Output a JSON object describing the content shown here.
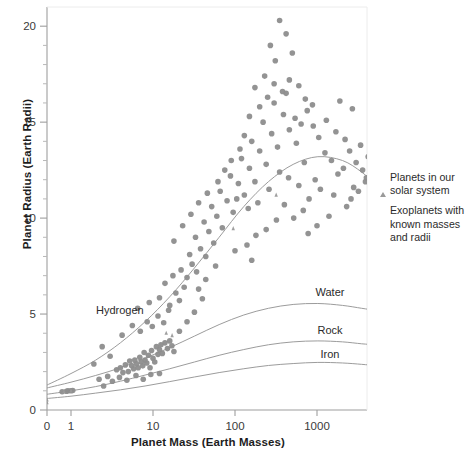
{
  "chart_data": {
    "type": "scatter",
    "title": "",
    "xlabel": "Planet Mass (Earth Masses)",
    "ylabel": "Planet Radius (Earth Radii)",
    "xscale": "log",
    "yscale": "linear",
    "xlim": [
      0.45,
      5000
    ],
    "ylim": [
      0,
      21
    ],
    "xticks": [
      0,
      1,
      10,
      100,
      1000
    ],
    "xticklabels": [
      "0",
      "1",
      "10",
      "100",
      "1000"
    ],
    "yticks": [
      0,
      5,
      10,
      15,
      20
    ],
    "yticklabels": [
      "0",
      "5",
      "10",
      "15",
      "20"
    ],
    "yminorticks": [
      1,
      2,
      3,
      4,
      6,
      7,
      8,
      9,
      11,
      12,
      13,
      14,
      16,
      17,
      18,
      19
    ],
    "grid": false,
    "legend_position": "right",
    "marker_color": "#8d8d8d",
    "curve_color": "#9c9c9c",
    "axis_color": "#b8b8b8",
    "series": [
      {
        "name": "Exoplanets with known masses and radii",
        "marker": "circle",
        "color": "#8d8d8d",
        "points": [
          [
            0.78,
            0.95
          ],
          [
            0.92,
            1.0
          ],
          [
            1.0,
            1.0
          ],
          [
            1.05,
            1.02
          ],
          [
            0.88,
            0.98
          ],
          [
            3.6,
            2.1
          ],
          [
            4.0,
            2.2
          ],
          [
            4.3,
            1.95
          ],
          [
            4.6,
            2.35
          ],
          [
            5.0,
            2.0
          ],
          [
            5.2,
            2.55
          ],
          [
            5.5,
            2.3
          ],
          [
            5.8,
            2.15
          ],
          [
            6.0,
            2.6
          ],
          [
            6.3,
            2.4
          ],
          [
            6.6,
            2.2
          ],
          [
            6.9,
            2.75
          ],
          [
            7.2,
            2.5
          ],
          [
            7.5,
            2.3
          ],
          [
            7.8,
            3.0
          ],
          [
            8.0,
            2.6
          ],
          [
            8.4,
            2.45
          ],
          [
            8.8,
            2.85
          ],
          [
            9.2,
            2.2
          ],
          [
            9.6,
            3.1
          ],
          [
            10.0,
            2.7
          ],
          [
            10.5,
            2.5
          ],
          [
            11.0,
            3.3
          ],
          [
            11.5,
            2.9
          ],
          [
            12.0,
            3.15
          ],
          [
            12.5,
            3.4
          ],
          [
            13.0,
            2.95
          ],
          [
            14.0,
            3.5
          ],
          [
            15.0,
            3.2
          ],
          [
            16.0,
            3.6
          ],
          [
            17.0,
            3.35
          ],
          [
            18.0,
            3.05
          ],
          [
            4.2,
            3.9
          ],
          [
            5.6,
            4.4
          ],
          [
            7.0,
            4.1
          ],
          [
            8.5,
            4.6
          ],
          [
            9.8,
            4.35
          ],
          [
            11.5,
            4.9
          ],
          [
            13.5,
            4.55
          ],
          [
            15.5,
            5.2
          ],
          [
            6.5,
            5.3
          ],
          [
            9.0,
            5.6
          ],
          [
            12.0,
            5.85
          ],
          [
            16.0,
            5.45
          ],
          [
            19.0,
            6.1
          ],
          [
            21.0,
            5.7
          ],
          [
            24.0,
            6.4
          ],
          [
            14.0,
            6.6
          ],
          [
            17.5,
            7.0
          ],
          [
            22.0,
            7.3
          ],
          [
            26.0,
            6.9
          ],
          [
            30.0,
            7.6
          ],
          [
            34.0,
            7.2
          ],
          [
            28.0,
            8.1
          ],
          [
            38.0,
            8.4
          ],
          [
            44.0,
            8.0
          ],
          [
            33.0,
            9.0
          ],
          [
            48.0,
            9.3
          ],
          [
            55.0,
            8.7
          ],
          [
            42.0,
            9.8
          ],
          [
            60.0,
            10.1
          ],
          [
            70.0,
            9.5
          ],
          [
            52.0,
            10.6
          ],
          [
            80.0,
            10.9
          ],
          [
            95.0,
            10.3
          ],
          [
            66.0,
            11.4
          ],
          [
            110.0,
            11.8
          ],
          [
            130.0,
            11.2
          ],
          [
            88.0,
            12.2
          ],
          [
            150.0,
            12.6
          ],
          [
            175.0,
            11.9
          ],
          [
            120.0,
            13.1
          ],
          [
            200.0,
            13.5
          ],
          [
            240.0,
            12.8
          ],
          [
            160.0,
            14.0
          ],
          [
            280.0,
            14.4
          ],
          [
            330.0,
            13.7
          ],
          [
            220.0,
            15.0
          ],
          [
            390.0,
            15.4
          ],
          [
            460.0,
            14.6
          ],
          [
            300.0,
            16.0
          ],
          [
            540.0,
            15.2
          ],
          [
            640.0,
            14.9
          ],
          [
            420.0,
            16.5
          ],
          [
            760.0,
            15.6
          ],
          [
            900.0,
            14.8
          ],
          [
            560.0,
            13.9
          ],
          [
            1050.0,
            14.2
          ],
          [
            1250.0,
            13.4
          ],
          [
            700.0,
            12.9
          ],
          [
            1500.0,
            13.0
          ],
          [
            1800.0,
            12.3
          ],
          [
            950.0,
            12.0
          ],
          [
            2100.0,
            12.6
          ],
          [
            2500.0,
            13.5
          ],
          [
            3000.0,
            12.9
          ],
          [
            3600.0,
            12.5
          ],
          [
            4200.0,
            13.2
          ],
          [
            2800.0,
            11.6
          ],
          [
            1600.0,
            11.2
          ],
          [
            1100.0,
            11.5
          ],
          [
            800.0,
            11.0
          ],
          [
            600.0,
            11.7
          ],
          [
            450.0,
            12.1
          ],
          [
            350.0,
            12.4
          ],
          [
            260.0,
            11.5
          ],
          [
            190.0,
            10.8
          ],
          [
            145.0,
            10.5
          ],
          [
            105.0,
            11.0
          ],
          [
            175.0,
            16.8
          ],
          [
            230.0,
            17.4
          ],
          [
            310.0,
            18.2
          ],
          [
            270.0,
            19.0
          ],
          [
            350.0,
            20.3
          ],
          [
            420.0,
            19.6
          ],
          [
            500.0,
            18.6
          ],
          [
            200.0,
            15.8
          ],
          [
            250.0,
            16.3
          ],
          [
            300.0,
            17.0
          ],
          [
            380.0,
            16.6
          ],
          [
            460.0,
            17.2
          ],
          [
            150.0,
            15.3
          ],
          [
            130.0,
            14.3
          ],
          [
            115.0,
            13.6
          ],
          [
            90.0,
            13.0
          ],
          [
            75.0,
            12.5
          ],
          [
            62.0,
            11.9
          ],
          [
            600.0,
            16.9
          ],
          [
            720.0,
            16.2
          ],
          [
            880.0,
            15.9
          ],
          [
            1300.0,
            15.1
          ],
          [
            1700.0,
            14.5
          ],
          [
            2200.0,
            14.1
          ],
          [
            2700.0,
            15.7
          ],
          [
            3400.0,
            13.8
          ],
          [
            4000.0,
            12.1
          ],
          [
            4600.0,
            13.6
          ],
          [
            680.0,
            10.4
          ],
          [
            520.0,
            10.0
          ],
          [
            400.0,
            10.7
          ],
          [
            320.0,
            9.9
          ],
          [
            240.0,
            9.4
          ],
          [
            180.0,
            9.1
          ],
          [
            140.0,
            8.6
          ],
          [
            100.0,
            8.3
          ],
          [
            2.2,
            1.6
          ],
          [
            2.8,
            1.75
          ],
          [
            3.2,
            1.5
          ],
          [
            2.5,
            1.25
          ],
          [
            3.9,
            1.7
          ],
          [
            4.8,
            1.55
          ],
          [
            6.2,
            1.8
          ],
          [
            7.6,
            1.6
          ],
          [
            9.4,
            1.85
          ],
          [
            12.0,
            1.9
          ],
          [
            1.9,
            2.4
          ],
          [
            2.4,
            3.3
          ],
          [
            3.0,
            2.8
          ],
          [
            21.0,
            4.1
          ],
          [
            26.0,
            4.6
          ],
          [
            32.0,
            5.1
          ],
          [
            40.0,
            5.8
          ],
          [
            18.0,
            8.8
          ],
          [
            23.0,
            9.6
          ],
          [
            29.0,
            10.2
          ],
          [
            36.0,
            10.8
          ],
          [
            46.0,
            11.3
          ],
          [
            58.0,
            7.5
          ],
          [
            36.0,
            6.3
          ],
          [
            44.0,
            6.8
          ],
          [
            2600.0,
            11.0
          ],
          [
            3200.0,
            11.4
          ],
          [
            3900.0,
            11.9
          ],
          [
            4400.0,
            14.0
          ],
          [
            1900.0,
            16.1
          ],
          [
            2300.0,
            10.6
          ],
          [
            1400.0,
            10.1
          ],
          [
            1000.0,
            9.6
          ],
          [
            780.0,
            9.2
          ],
          [
            160.0,
            7.8
          ]
        ]
      },
      {
        "name": "Planets in our solar system",
        "marker": "triangle",
        "color": "#9a9a9a",
        "points": [
          [
            0.82,
            0.95
          ],
          [
            1.0,
            1.0
          ],
          [
            0.107,
            0.53
          ],
          [
            0.0553,
            0.38
          ],
          [
            14.5,
            4.0
          ],
          [
            17.1,
            3.88
          ],
          [
            95.2,
            9.45
          ],
          [
            317.8,
            11.2
          ]
        ],
        "labels": [
          "Venus",
          "Earth",
          "Mars",
          "Mercury",
          "Uranus",
          "Neptune",
          "Saturn",
          "Jupiter"
        ]
      }
    ],
    "curves": [
      {
        "name": "Hydrogen",
        "label": "Hydrogen",
        "points": [
          [
            0.5,
            1.3
          ],
          [
            1,
            1.9
          ],
          [
            2,
            2.6
          ],
          [
            4,
            3.5
          ],
          [
            8,
            4.6
          ],
          [
            16,
            5.9
          ],
          [
            32,
            7.4
          ],
          [
            64,
            9.0
          ],
          [
            128,
            10.6
          ],
          [
            256,
            11.9
          ],
          [
            512,
            12.8
          ],
          [
            1024,
            13.2
          ],
          [
            2048,
            13.0
          ],
          [
            3500,
            12.4
          ],
          [
            5000,
            11.8
          ]
        ]
      },
      {
        "name": "Water",
        "label": "Water",
        "points": [
          [
            0.5,
            1.15
          ],
          [
            1,
            1.45
          ],
          [
            2,
            1.8
          ],
          [
            4,
            2.2
          ],
          [
            8,
            2.7
          ],
          [
            16,
            3.25
          ],
          [
            32,
            3.85
          ],
          [
            64,
            4.45
          ],
          [
            128,
            4.95
          ],
          [
            256,
            5.3
          ],
          [
            512,
            5.5
          ],
          [
            1024,
            5.55
          ],
          [
            2048,
            5.45
          ],
          [
            3500,
            5.3
          ],
          [
            5000,
            5.2
          ]
        ]
      },
      {
        "name": "Rock",
        "label": "Rock",
        "points": [
          [
            0.5,
            0.82
          ],
          [
            1,
            1.0
          ],
          [
            2,
            1.22
          ],
          [
            4,
            1.5
          ],
          [
            8,
            1.82
          ],
          [
            16,
            2.15
          ],
          [
            32,
            2.5
          ],
          [
            64,
            2.85
          ],
          [
            128,
            3.15
          ],
          [
            256,
            3.4
          ],
          [
            512,
            3.55
          ],
          [
            1024,
            3.6
          ],
          [
            2048,
            3.55
          ],
          [
            3500,
            3.45
          ],
          [
            5000,
            3.4
          ]
        ]
      },
      {
        "name": "Iron",
        "label": "Iron",
        "points": [
          [
            0.5,
            0.6
          ],
          [
            1,
            0.72
          ],
          [
            2,
            0.88
          ],
          [
            4,
            1.05
          ],
          [
            8,
            1.25
          ],
          [
            16,
            1.48
          ],
          [
            32,
            1.72
          ],
          [
            64,
            1.95
          ],
          [
            128,
            2.15
          ],
          [
            256,
            2.32
          ],
          [
            512,
            2.42
          ],
          [
            1024,
            2.48
          ],
          [
            2048,
            2.45
          ],
          [
            3500,
            2.38
          ],
          [
            5000,
            2.32
          ]
        ]
      }
    ]
  },
  "legend": {
    "entries": [
      {
        "marker": "triangle",
        "label": "Planets in our solar system"
      },
      {
        "marker": "circle",
        "label": "Exoplanets with known masses and radii"
      }
    ]
  },
  "axes": {
    "xlabel": "Planet Mass (Earth Masses)",
    "ylabel": "Planet Radius (Earth Radii)"
  }
}
